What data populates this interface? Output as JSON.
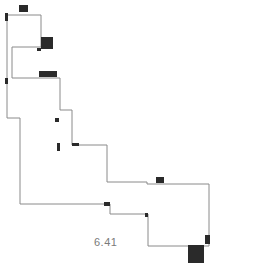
{
  "diagram": {
    "type": "floor-plan-outline",
    "outline_color": "#8a8a8a",
    "marker_color": "#2a2a2a",
    "area_label": "6.41",
    "outline_points": [
      [
        7,
        15
      ],
      [
        41,
        15
      ],
      [
        41,
        47
      ],
      [
        12,
        47
      ],
      [
        12,
        78
      ],
      [
        60,
        78
      ],
      [
        60,
        110
      ],
      [
        72,
        110
      ],
      [
        72,
        145
      ],
      [
        107,
        145
      ],
      [
        107,
        182
      ],
      [
        147,
        182
      ],
      [
        147,
        184
      ],
      [
        209,
        184
      ],
      [
        209,
        246
      ],
      [
        148,
        246
      ],
      [
        148,
        214
      ],
      [
        110,
        214
      ],
      [
        110,
        204
      ],
      [
        20,
        204
      ],
      [
        20,
        118
      ],
      [
        7,
        118
      ]
    ],
    "markers": [
      {
        "x": 19,
        "y": 5,
        "w": 9,
        "h": 7
      },
      {
        "x": 5,
        "y": 13,
        "w": 3,
        "h": 8
      },
      {
        "x": 41,
        "y": 37,
        "w": 12,
        "h": 12
      },
      {
        "x": 37,
        "y": 48,
        "w": 4,
        "h": 3
      },
      {
        "x": 39,
        "y": 71,
        "w": 18,
        "h": 6
      },
      {
        "x": 5,
        "y": 78,
        "w": 3,
        "h": 6
      },
      {
        "x": 55,
        "y": 118,
        "w": 4,
        "h": 4
      },
      {
        "x": 57,
        "y": 143,
        "w": 3,
        "h": 8
      },
      {
        "x": 72,
        "y": 143,
        "w": 7,
        "h": 3
      },
      {
        "x": 156,
        "y": 177,
        "w": 8,
        "h": 6
      },
      {
        "x": 104,
        "y": 202,
        "w": 6,
        "h": 4
      },
      {
        "x": 145,
        "y": 213,
        "w": 3,
        "h": 4
      },
      {
        "x": 205,
        "y": 235,
        "w": 5,
        "h": 9
      },
      {
        "x": 188,
        "y": 245,
        "w": 16,
        "h": 18
      }
    ],
    "label_position": {
      "x": 94,
      "y": 236
    }
  }
}
